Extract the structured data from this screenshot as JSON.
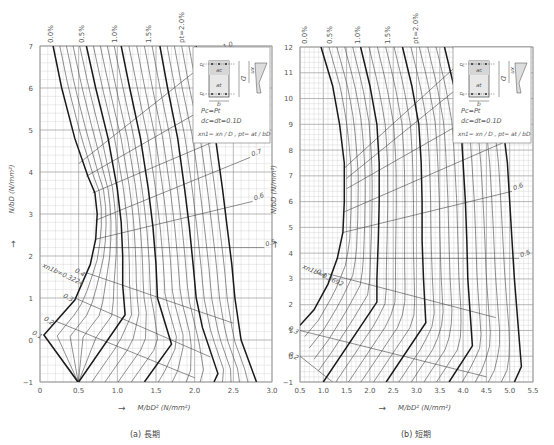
{
  "chart_data": [
    {
      "type": "line",
      "id": "long_term",
      "title": "(a) 長期",
      "xlabel": "M/bD² (N/mm²)",
      "ylabel": "N/bD (N/mm²)",
      "xlim": [
        0,
        3.0
      ],
      "ylim": [
        -1,
        7
      ],
      "xticks": [
        "0",
        "0.5",
        "1.0",
        "1.5",
        "2.0",
        "2.5",
        "3.0"
      ],
      "yticks": [
        "-1",
        "0",
        "1",
        "2",
        "3",
        "4",
        "5",
        "6",
        "7"
      ],
      "grid": true,
      "p_labels": [
        "0.0%",
        "0.5%",
        "1.0%",
        "1.5%",
        "pt=2.0%"
      ],
      "xn1_labels": [
        "xn1=1.0",
        "0.9",
        "0.8",
        "0.7",
        "0.6",
        "0.5",
        "0.4",
        "0.3",
        "0.2",
        "0.1"
      ],
      "balance_label": "xn1b=0.3224",
      "series": [
        {
          "name": "pt=0.0%",
          "points": [
            [
              0.17,
              7
            ],
            [
              0.28,
              6
            ],
            [
              0.45,
              4.8
            ],
            [
              0.62,
              3.9
            ],
            [
              0.71,
              3.5
            ],
            [
              0.74,
              3.0
            ],
            [
              0.72,
              2.4
            ],
            [
              0.65,
              1.8
            ],
            [
              0.45,
              0.95
            ],
            [
              0.05,
              0.12
            ],
            [
              0.49,
              -1
            ]
          ]
        },
        {
          "name": "pt=0.5%",
          "points": [
            [
              0.6,
              7
            ],
            [
              0.72,
              6
            ],
            [
              0.88,
              4.8
            ],
            [
              1.0,
              3.6
            ],
            [
              1.05,
              2.8
            ],
            [
              1.07,
              2.0
            ],
            [
              1.07,
              1.3
            ],
            [
              1.1,
              0.6
            ],
            [
              0.5,
              -1
            ]
          ]
        },
        {
          "name": "pt=1.0%",
          "points": [
            [
              1.05,
              7
            ],
            [
              1.16,
              6
            ],
            [
              1.3,
              4.8
            ],
            [
              1.4,
              3.6
            ],
            [
              1.46,
              2.7
            ],
            [
              1.5,
              1.8
            ],
            [
              1.52,
              1.0
            ],
            [
              1.7,
              -0.1
            ],
            [
              1.35,
              -1
            ]
          ]
        },
        {
          "name": "pt=1.5%",
          "points": [
            [
              1.55,
              7
            ],
            [
              1.65,
              6
            ],
            [
              1.78,
              4.8
            ],
            [
              1.87,
              3.6
            ],
            [
              1.93,
              2.7
            ],
            [
              1.98,
              1.8
            ],
            [
              2.02,
              1.0
            ],
            [
              2.1,
              0.3
            ],
            [
              2.3,
              -0.8
            ],
            [
              2.25,
              -1
            ]
          ]
        },
        {
          "name": "pt=2.0%",
          "points": [
            [
              2.02,
              7
            ],
            [
              2.12,
              6
            ],
            [
              2.27,
              4.8
            ],
            [
              2.36,
              3.6
            ],
            [
              2.42,
              2.7
            ],
            [
              2.48,
              1.8
            ],
            [
              2.52,
              1.0
            ],
            [
              2.6,
              0.0
            ],
            [
              2.8,
              -1
            ]
          ]
        }
      ],
      "xn1_lines": [
        {
          "label": "1.0",
          "points": [
            [
              0.5,
              4.2
            ],
            [
              2.35,
              6.9
            ]
          ]
        },
        {
          "label": "0.9",
          "points": [
            [
              0.6,
              3.9
            ],
            [
              2.5,
              5.9
            ]
          ]
        },
        {
          "label": "0.8",
          "points": [
            [
              0.68,
              3.5
            ],
            [
              2.6,
              5.0
            ]
          ]
        },
        {
          "label": "0.7",
          "points": [
            [
              0.72,
              2.85
            ],
            [
              2.72,
              4.35
            ]
          ]
        },
        {
          "label": "0.6",
          "points": [
            [
              0.72,
              2.4
            ],
            [
              2.75,
              3.3
            ]
          ]
        },
        {
          "label": "0.5",
          "points": [
            [
              0.7,
              2.2
            ],
            [
              2.9,
              2.2
            ]
          ]
        },
        {
          "label": "0.4",
          "points": [
            [
              0.6,
              1.6
            ],
            [
              2.5,
              0.4
            ]
          ]
        },
        {
          "label": "0.3",
          "points": [
            [
              0.45,
              1.0
            ],
            [
              2.2,
              -0.4
            ]
          ]
        },
        {
          "label": "0.2",
          "points": [
            [
              0.2,
              0.45
            ],
            [
              2.0,
              -0.9
            ]
          ]
        },
        {
          "label": "0.1",
          "points": [
            [
              0.05,
              0.12
            ],
            [
              0.5,
              -1
            ]
          ]
        }
      ]
    },
    {
      "type": "line",
      "id": "short_term",
      "title": "(b) 短期",
      "xlabel": "M/bD² (N/mm²)",
      "ylabel": "N/bD (N/mm²)",
      "xlim": [
        0.5,
        5.5
      ],
      "ylim": [
        -1,
        12
      ],
      "xticks": [
        "0.5",
        "1.0",
        "1.5",
        "2.0",
        "2.5",
        "3.0",
        "3.5",
        "4.0",
        "4.5",
        "5.0",
        "5.5"
      ],
      "yticks": [
        "-1",
        "0",
        "1",
        "2",
        "3",
        "4",
        "5",
        "6",
        "7",
        "8",
        "9",
        "10",
        "11",
        "12"
      ],
      "grid": true,
      "p_labels": [
        "0.0%",
        "0.5%",
        "1.0%",
        "1.5%",
        "pt=2.0%"
      ],
      "xn1_labels": [
        "xn1=1.0",
        "0.9",
        "0.8",
        "0.7",
        "0.6",
        "0.5",
        "0.4",
        "0.3",
        "0.2"
      ],
      "balance_label": "xn1b=0.3692",
      "series": [
        {
          "name": "pt=0.0%",
          "points": [
            [
              0.95,
              12
            ],
            [
              1.2,
              10.5
            ],
            [
              1.35,
              9.0
            ],
            [
              1.45,
              7.5
            ],
            [
              1.45,
              6.0
            ],
            [
              1.42,
              4.8
            ],
            [
              1.3,
              3.8
            ],
            [
              1.1,
              2.8
            ],
            [
              0.8,
              1.8
            ],
            [
              0.5,
              1.2
            ]
          ]
        },
        {
          "name": "pt=0.5%",
          "points": [
            [
              1.8,
              12
            ],
            [
              2.0,
              10.5
            ],
            [
              2.15,
              9.0
            ],
            [
              2.2,
              7.5
            ],
            [
              2.2,
              6.0
            ],
            [
              2.18,
              4.5
            ],
            [
              2.15,
              3.0
            ],
            [
              2.15,
              2.1
            ],
            [
              1.0,
              -1
            ]
          ]
        },
        {
          "name": "pt=1.0%",
          "points": [
            [
              2.7,
              12
            ],
            [
              2.9,
              10.5
            ],
            [
              3.05,
              9.0
            ],
            [
              3.1,
              7.5
            ],
            [
              3.12,
              6.0
            ],
            [
              3.12,
              4.5
            ],
            [
              3.15,
              3.0
            ],
            [
              3.2,
              1.3
            ],
            [
              2.35,
              -1
            ]
          ]
        },
        {
          "name": "pt=1.5%",
          "points": [
            [
              3.6,
              12
            ],
            [
              3.8,
              10.5
            ],
            [
              3.95,
              9.0
            ],
            [
              4.0,
              7.5
            ],
            [
              4.05,
              6.0
            ],
            [
              4.08,
              4.5
            ],
            [
              4.1,
              3.0
            ],
            [
              4.2,
              0.4
            ],
            [
              3.7,
              -1
            ]
          ]
        },
        {
          "name": "pt=2.0%",
          "points": [
            [
              4.5,
              12
            ],
            [
              4.7,
              10.5
            ],
            [
              4.85,
              9.0
            ],
            [
              4.95,
              7.5
            ],
            [
              5.0,
              6.0
            ],
            [
              5.05,
              4.5
            ],
            [
              5.1,
              3.0
            ],
            [
              5.25,
              -0.4
            ],
            [
              5.1,
              -1
            ]
          ]
        }
      ],
      "xn1_lines": [
        {
          "label": "1.0",
          "points": [
            [
              1.45,
              7.3
            ],
            [
              4.0,
              11.5
            ]
          ]
        },
        {
          "label": "0.9",
          "points": [
            [
              1.5,
              6.9
            ],
            [
              4.7,
              11.6
            ]
          ]
        },
        {
          "label": "0.8",
          "points": [
            [
              1.5,
              6.5
            ],
            [
              4.9,
              10.0
            ]
          ]
        },
        {
          "label": "0.7",
          "points": [
            [
              1.45,
              5.6
            ],
            [
              5.0,
              8.4
            ]
          ]
        },
        {
          "label": "0.6",
          "points": [
            [
              1.42,
              4.8
            ],
            [
              5.05,
              6.4
            ]
          ]
        },
        {
          "label": "0.5",
          "points": [
            [
              1.3,
              3.8
            ],
            [
              5.2,
              3.8
            ]
          ]
        },
        {
          "label": "0.4",
          "points": [
            [
              1.1,
              3.2
            ],
            [
              4.7,
              1.5
            ]
          ]
        },
        {
          "label": "0.3",
          "points": [
            [
              0.5,
              1.0
            ],
            [
              4.5,
              -0.8
            ]
          ]
        },
        {
          "label": "0.2",
          "points": [
            [
              0.5,
              0.0
            ],
            [
              1.2,
              -1
            ]
          ]
        }
      ]
    }
  ],
  "legend": {
    "eq1": "Pc=Pt",
    "eq2": "dc=dt=0.1D",
    "eq3": "xn1= xn / D ,  pt= at / bD",
    "labels": {
      "b": "b",
      "D": "D",
      "d": "d",
      "xn": "xn",
      "at": "at",
      "ac": "ac"
    }
  },
  "axes": {
    "left_ylabel": "N/bD (N/mm²)",
    "right_ylabel": "N/bD (N/mm²)",
    "xlabel": "M/bD² (N/mm²)",
    "arrow": "→"
  },
  "captions": {
    "left": "(a) 長期",
    "right": "(b) 短期"
  },
  "colors": {
    "grid_minor": "#cfcfcf",
    "grid_major": "#9a9a9a",
    "curve_bold": "#1a1a1a",
    "curve_thin": "#444444",
    "axis_text": "#555555"
  }
}
